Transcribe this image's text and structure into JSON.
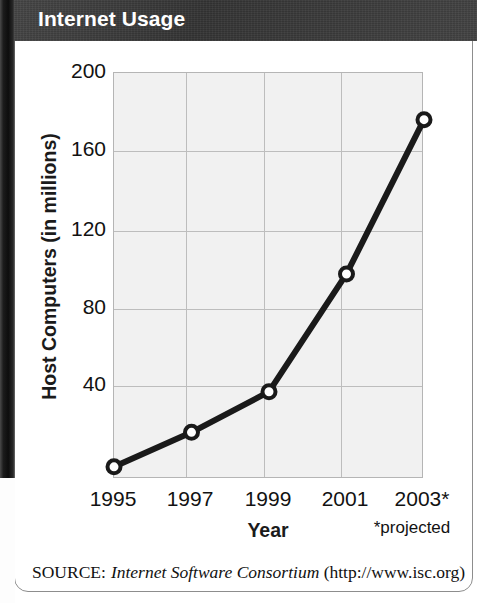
{
  "header": {
    "title": "Internet Usage"
  },
  "source": {
    "label": "SOURCE:",
    "organization": "Internet Software Consortium",
    "url": "(http://www.isc.org)"
  },
  "footnote": {
    "projected": "*projected"
  },
  "colors": {
    "title_bar": "#3a3a3a",
    "title_text": "#ffffff",
    "plot_background": "#f1f1f1",
    "gridline": "#bdbdbd",
    "series_line": "#1a1a1a",
    "marker_fill": "#ffffff",
    "card_border": "#8d8d8d"
  },
  "chart_data": {
    "type": "line",
    "title": "Internet Usage",
    "xlabel": "Year",
    "ylabel": "Host Computers (in millions)",
    "categories": [
      "1995",
      "1997",
      "1999",
      "2001",
      "2003*"
    ],
    "x": [
      1995,
      1997,
      1999,
      2001,
      2003
    ],
    "values": [
      6,
      23,
      43,
      101,
      177
    ],
    "series": [
      {
        "name": "Host Computers (in millions)",
        "values": [
          6,
          23,
          43,
          101,
          177
        ]
      }
    ],
    "ylim": [
      0,
      200
    ],
    "yticks": [
      40,
      80,
      120,
      160,
      200
    ],
    "ytick_labels": [
      "40",
      "80",
      "120",
      "160",
      "200"
    ],
    "xtick_labels": [
      "1995",
      "1997",
      "1999",
      "2001",
      "2003*"
    ],
    "grid": true,
    "legend": "none",
    "marker": "open-circle",
    "annotations": [
      "*projected"
    ]
  }
}
